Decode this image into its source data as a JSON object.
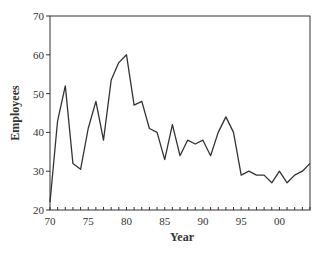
{
  "chart_data": {
    "type": "line",
    "title": "",
    "xlabel": "Year",
    "ylabel": "Employees",
    "xlim": [
      1970,
      2004
    ],
    "ylim": [
      20,
      70
    ],
    "grid": false,
    "legend": null,
    "x_tick_labels": [
      "70",
      "75",
      "80",
      "85",
      "90",
      "95",
      "00"
    ],
    "x_tick_values": [
      1970,
      1975,
      1980,
      1985,
      1990,
      1995,
      2000
    ],
    "y_tick_labels": [
      "20",
      "30",
      "40",
      "50",
      "60",
      "70"
    ],
    "y_tick_values": [
      20,
      30,
      40,
      50,
      60,
      70
    ],
    "series": [
      {
        "name": "Employees",
        "color": "#333333",
        "x": [
          1970,
          1971,
          1972,
          1973,
          1974,
          1975,
          1976,
          1977,
          1978,
          1979,
          1980,
          1981,
          1982,
          1983,
          1984,
          1985,
          1986,
          1987,
          1988,
          1989,
          1990,
          1991,
          1992,
          1993,
          1994,
          1995,
          1996,
          1997,
          1998,
          1999,
          2000,
          2001,
          2002,
          2003,
          2004
        ],
        "values": [
          22,
          43,
          52,
          32,
          30.5,
          41,
          48,
          38,
          53.5,
          58,
          60,
          47,
          48,
          41,
          40,
          33,
          42,
          34,
          38,
          37,
          38,
          34,
          40,
          44,
          40,
          29,
          30,
          29,
          29,
          27,
          30,
          27,
          29,
          30,
          32
        ]
      }
    ]
  }
}
